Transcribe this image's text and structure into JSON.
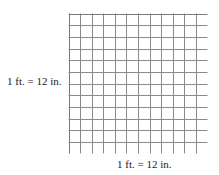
{
  "diagram": {
    "type": "grid",
    "rows": 12,
    "columns": 12,
    "side_label": "1 ft. = 12 in.",
    "bottom_label": "1 ft. = 12 in.",
    "line_color": "#8a8a8a",
    "border_color": "#7a7a7a"
  }
}
